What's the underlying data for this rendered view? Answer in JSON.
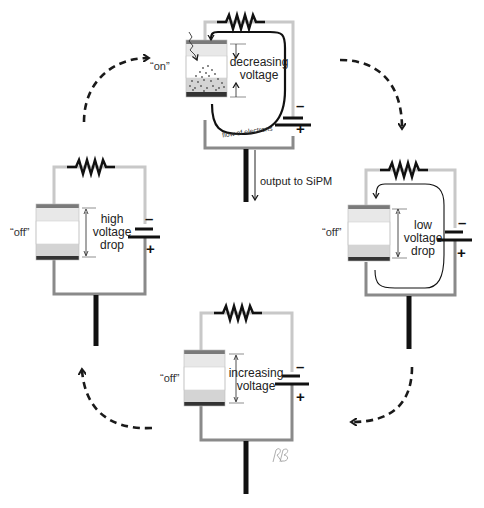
{
  "diagram": {
    "colors": {
      "wire_light": "#c8c8c8",
      "wire_dark": "#8a8a8a",
      "resistor": "#111111",
      "output_bar": "#111111",
      "cell_layer_light": "#e8e8e8",
      "cell_layer_mid": "#d4d4d4",
      "cell_top_contact": "#7a7a7a",
      "cell_bottom_contact": "#333333",
      "arrow": "#1a1a1a"
    },
    "stages": [
      {
        "id": "top",
        "state_label": "“on”",
        "voltage_label_line1": "decreasing",
        "voltage_label_line2": "voltage",
        "flow_label": "flow of electrons",
        "output_label": "output to SiPM",
        "battery_minus": "–",
        "battery_plus": "+"
      },
      {
        "id": "right",
        "state_label": "“off”",
        "voltage_label_line1": "low",
        "voltage_label_line2": "voltage",
        "voltage_label_line3": "drop",
        "battery_minus": "–",
        "battery_plus": "+"
      },
      {
        "id": "bottom",
        "state_label": "“off”",
        "voltage_label_line1": "increasing",
        "voltage_label_line2": "voltage",
        "battery_minus": "–",
        "battery_plus": "+"
      },
      {
        "id": "left",
        "state_label": "“off”",
        "voltage_label_line1": "high",
        "voltage_label_line2": "voltage",
        "voltage_label_line3": "drop",
        "battery_minus": "–",
        "battery_plus": "+"
      }
    ],
    "cycle_arrows": [
      "left-to-top",
      "top-to-right",
      "right-to-bottom",
      "bottom-to-left"
    ],
    "signature": "RB"
  }
}
